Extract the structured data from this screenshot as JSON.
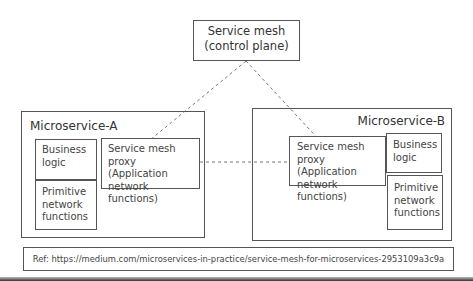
{
  "control_plane": {
    "title": "Service mesh\n(control plane)"
  },
  "microservice_a": {
    "title": "Microservice-A",
    "business_logic": "Business\nlogic",
    "primitive": "Primitive\nnetwork\nfunctions",
    "proxy": "Service mesh proxy\n(Application\nnetwork functions)"
  },
  "microservice_b": {
    "title": "Microservice-B",
    "business_logic": "Business\nlogic",
    "primitive": "Primitive\nnetwork\nfunctions",
    "proxy": "Service mesh proxy\n(Application\nnetwork functions)"
  },
  "reference": {
    "text": "Ref: https://medium.com/microservices-in-practice/service-mesh-for-microservices-2953109a3c9a"
  },
  "colors": {
    "line": "#555555",
    "dash": "#777777"
  }
}
